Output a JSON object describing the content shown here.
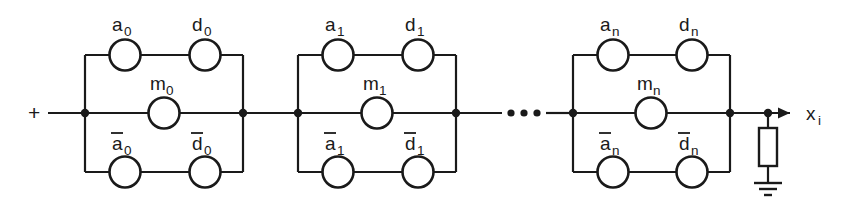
{
  "diagram": {
    "type": "circuit-schematic",
    "input_label": "+",
    "output_label": "x",
    "output_subscript": "i",
    "ellipsis": "•••",
    "colors": {
      "line": "#1a1a1a",
      "background": "#ffffff"
    },
    "cells": [
      {
        "id": "cell-0",
        "subscript": "0",
        "top_left": {
          "label": "a",
          "subscript": "0",
          "overbar": false
        },
        "top_right": {
          "label": "d",
          "subscript": "0",
          "overbar": false
        },
        "middle": {
          "label": "m",
          "subscript": "0",
          "overbar": false
        },
        "bottom_left": {
          "label": "a",
          "subscript": "0",
          "overbar": true
        },
        "bottom_right": {
          "label": "d",
          "subscript": "0",
          "overbar": true
        }
      },
      {
        "id": "cell-1",
        "subscript": "1",
        "top_left": {
          "label": "a",
          "subscript": "1",
          "overbar": false
        },
        "top_right": {
          "label": "d",
          "subscript": "1",
          "overbar": false
        },
        "middle": {
          "label": "m",
          "subscript": "1",
          "overbar": false
        },
        "bottom_left": {
          "label": "a",
          "subscript": "1",
          "overbar": true
        },
        "bottom_right": {
          "label": "d",
          "subscript": "1",
          "overbar": true
        }
      },
      {
        "id": "cell-n",
        "subscript": "n",
        "top_left": {
          "label": "a",
          "subscript": "n",
          "overbar": false
        },
        "top_right": {
          "label": "d",
          "subscript": "n",
          "overbar": false
        },
        "middle": {
          "label": "m",
          "subscript": "n",
          "overbar": false
        },
        "bottom_left": {
          "label": "a",
          "subscript": "n",
          "overbar": true
        },
        "bottom_right": {
          "label": "d",
          "subscript": "n",
          "overbar": true
        }
      }
    ],
    "termination": {
      "component": "resistor",
      "connection": "ground"
    }
  }
}
